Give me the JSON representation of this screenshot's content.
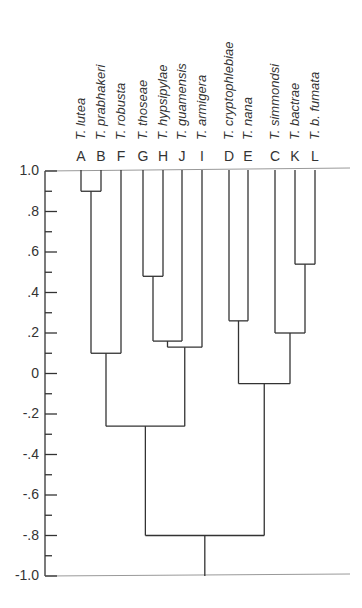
{
  "chart_data": {
    "type": "dendrogram",
    "title": "",
    "ylabel": "",
    "ylim": [
      -1.0,
      1.0
    ],
    "y_ticks": [
      1.0,
      0.8,
      0.6,
      0.4,
      0.2,
      0,
      -0.2,
      -0.4,
      -0.6,
      -0.8,
      -1.0
    ],
    "y_tick_labels": [
      "1.0",
      ".8",
      ".6",
      ".4",
      ".2",
      "0",
      "-.2",
      "-.4",
      "-.6",
      "-.8",
      "-1.0"
    ],
    "leaves": [
      {
        "code": "A",
        "name": "T. lutea"
      },
      {
        "code": "B",
        "name": "T. prabhakeri"
      },
      {
        "code": "F",
        "name": "T. robusta"
      },
      {
        "code": "G",
        "name": "T. thoseae"
      },
      {
        "code": "H",
        "name": "T. hypsipylae"
      },
      {
        "code": "J",
        "name": "T. guamensis"
      },
      {
        "code": "I",
        "name": "T. armigera"
      },
      {
        "code": "D",
        "name": "T. cryptophlebiae"
      },
      {
        "code": "E",
        "name": "T. nana"
      },
      {
        "code": "C",
        "name": "T. simmondsi"
      },
      {
        "code": "K",
        "name": "T. bactrae"
      },
      {
        "code": "L",
        "name": "T. b. fumata"
      }
    ],
    "merges": [
      {
        "cluster": [
          "A",
          "B"
        ],
        "height": 0.9
      },
      {
        "cluster": [
          "G",
          "H"
        ],
        "height": 0.48
      },
      {
        "cluster": [
          "GH",
          "J"
        ],
        "height": 0.16
      },
      {
        "cluster": [
          "GHJ",
          "I"
        ],
        "height": 0.13
      },
      {
        "cluster": [
          "AB",
          "F"
        ],
        "height": 0.1
      },
      {
        "cluster": [
          "ABF",
          "GHJI"
        ],
        "height": -0.26
      },
      {
        "cluster": [
          "D",
          "E"
        ],
        "height": 0.26
      },
      {
        "cluster": [
          "K",
          "L"
        ],
        "height": 0.54
      },
      {
        "cluster": [
          "C",
          "KL"
        ],
        "height": 0.2
      },
      {
        "cluster": [
          "DE",
          "CKL"
        ],
        "height": -0.05
      },
      {
        "cluster": [
          "ABFGHJI",
          "DECKL"
        ],
        "height": -0.8
      }
    ]
  }
}
